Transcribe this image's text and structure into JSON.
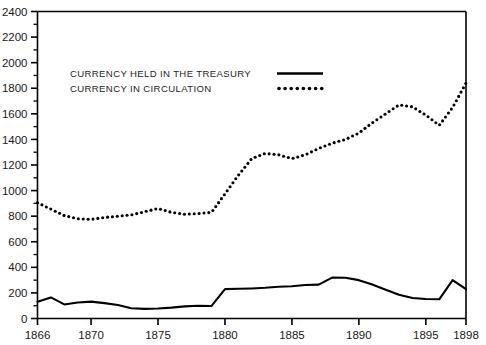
{
  "chart_data": {
    "type": "line",
    "title": "",
    "xlabel": "",
    "ylabel": "",
    "xlim": [
      1866,
      1898
    ],
    "ylim": [
      0,
      2400
    ],
    "grid": false,
    "legend_position": "upper-left-inside",
    "x_ticks": [
      1866,
      1870,
      1875,
      1880,
      1885,
      1890,
      1895,
      1898
    ],
    "x_tick_labels": [
      "1866",
      "1870",
      "1875",
      "1880",
      "1885",
      "1890",
      "1895",
      "1898"
    ],
    "y_ticks": [
      0,
      200,
      400,
      600,
      800,
      1000,
      1200,
      1400,
      1600,
      1800,
      2000,
      2200,
      2400
    ],
    "y_tick_labels": [
      "0",
      "200",
      "400",
      "600",
      "800",
      "1000",
      "1200",
      "1400",
      "1600",
      "1800",
      "2000",
      "2200",
      "2400"
    ],
    "y_minor_ticks": [
      100,
      300,
      500,
      700,
      900,
      1100,
      1300,
      1500,
      1700,
      1900,
      2100,
      2300
    ],
    "x": [
      1866,
      1867,
      1868,
      1869,
      1870,
      1871,
      1872,
      1873,
      1874,
      1875,
      1876,
      1877,
      1878,
      1879,
      1880,
      1881,
      1882,
      1883,
      1884,
      1885,
      1886,
      1887,
      1888,
      1889,
      1890,
      1891,
      1892,
      1893,
      1894,
      1895,
      1896,
      1897,
      1898
    ],
    "series": [
      {
        "name": "CURRENCY HELD IN THE TREASURY",
        "style": "solid",
        "color": "#000000",
        "values": [
          130,
          165,
          110,
          125,
          132,
          120,
          105,
          80,
          75,
          78,
          85,
          95,
          100,
          98,
          230,
          232,
          235,
          240,
          248,
          252,
          262,
          265,
          320,
          318,
          300,
          265,
          225,
          185,
          160,
          152,
          150,
          300,
          230
        ]
      },
      {
        "name": "CURRENCY IN CIRCULATION",
        "style": "dotted",
        "color": "#000000",
        "values": [
          905,
          855,
          805,
          780,
          775,
          790,
          800,
          810,
          835,
          860,
          830,
          815,
          820,
          830,
          975,
          1120,
          1250,
          1290,
          1280,
          1250,
          1280,
          1330,
          1370,
          1400,
          1450,
          1530,
          1600,
          1670,
          1655,
          1590,
          1510,
          1650,
          1840
        ]
      }
    ],
    "legend": [
      {
        "label": "CURRENCY HELD IN THE TREASURY",
        "style": "solid"
      },
      {
        "label": "CURRENCY IN CIRCULATION",
        "style": "dotted"
      }
    ]
  }
}
